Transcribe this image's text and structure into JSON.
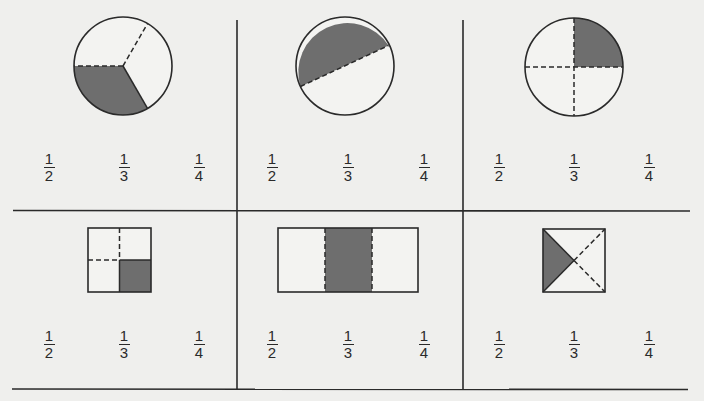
{
  "colors": {
    "background": "#efefed",
    "line": "#2a2a2a",
    "shade": "#6e6e6e",
    "shape_fill": "#f3f3f1"
  },
  "grid": {
    "rows": 2,
    "columns": 3
  },
  "panels": [
    {
      "id": "circle-thirds",
      "shape": "circle",
      "divisions": 3,
      "shaded_parts": 1,
      "description": "Circle divided into 3 equal sectors, 1 shaded",
      "choices": [
        {
          "numerator": "1",
          "denominator": "2"
        },
        {
          "numerator": "1",
          "denominator": "3"
        },
        {
          "numerator": "1",
          "denominator": "4"
        }
      ]
    },
    {
      "id": "circle-unequal-chord",
      "shape": "circle",
      "divisions": 2,
      "shaded_parts": 1,
      "description": "Circle cut by an off-center chord into 2 unequal parts, larger upper part shaded",
      "choices": [
        {
          "numerator": "1",
          "denominator": "2"
        },
        {
          "numerator": "1",
          "denominator": "3"
        },
        {
          "numerator": "1",
          "denominator": "4"
        }
      ]
    },
    {
      "id": "circle-quarters",
      "shape": "circle",
      "divisions": 4,
      "shaded_parts": 1,
      "description": "Circle divided into 4 equal quadrants, upper-right shaded",
      "choices": [
        {
          "numerator": "1",
          "denominator": "2"
        },
        {
          "numerator": "1",
          "denominator": "3"
        },
        {
          "numerator": "1",
          "denominator": "4"
        }
      ]
    },
    {
      "id": "square-quarters",
      "shape": "square",
      "divisions": 4,
      "shaded_parts": 1,
      "description": "Square divided into 4 equal squares, lower-right shaded",
      "choices": [
        {
          "numerator": "1",
          "denominator": "2"
        },
        {
          "numerator": "1",
          "denominator": "3"
        },
        {
          "numerator": "1",
          "denominator": "4"
        }
      ]
    },
    {
      "id": "rectangle-thirds",
      "shape": "rectangle",
      "divisions": 3,
      "shaded_parts": 1,
      "description": "Rectangle divided into 3 vertical strips, middle shaded",
      "choices": [
        {
          "numerator": "1",
          "denominator": "2"
        },
        {
          "numerator": "1",
          "denominator": "3"
        },
        {
          "numerator": "1",
          "denominator": "4"
        }
      ]
    },
    {
      "id": "square-diagonal-quarters",
      "shape": "square",
      "divisions": 4,
      "shaded_parts": 1,
      "description": "Square divided by both diagonals into 4 triangles, left triangle shaded",
      "choices": [
        {
          "numerator": "1",
          "denominator": "2"
        },
        {
          "numerator": "1",
          "denominator": "3"
        },
        {
          "numerator": "1",
          "denominator": "4"
        }
      ]
    }
  ]
}
